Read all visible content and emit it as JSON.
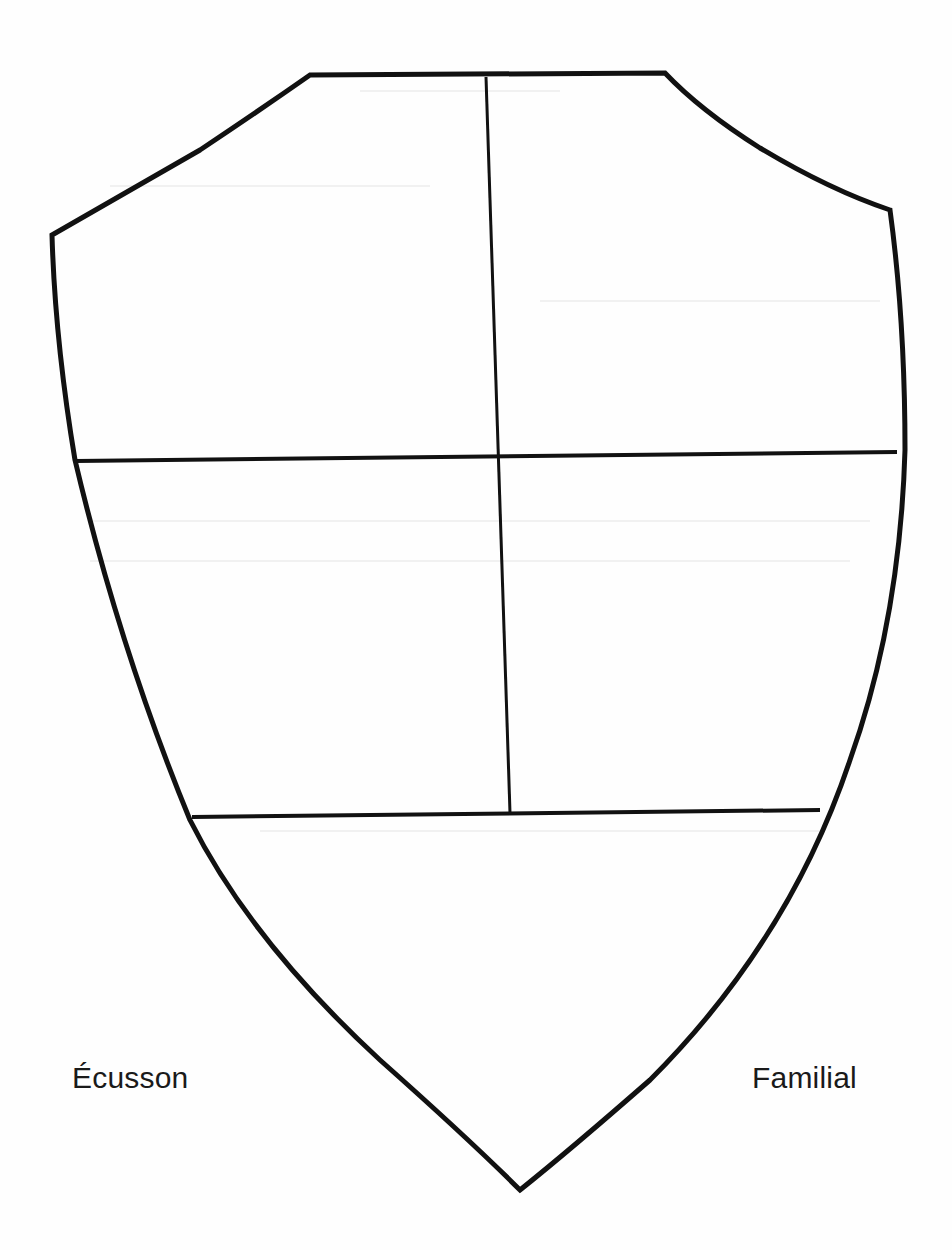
{
  "figure": {
    "type": "shield-template",
    "stroke_color": "#111111",
    "background_color": "#fefefe",
    "sections": [
      {
        "id": "top-left"
      },
      {
        "id": "top-right"
      },
      {
        "id": "middle-left"
      },
      {
        "id": "middle-right"
      },
      {
        "id": "bottom-point"
      }
    ]
  },
  "labels": {
    "left": "Écusson",
    "right": "Familial"
  }
}
